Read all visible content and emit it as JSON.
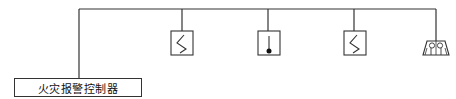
{
  "diagram": {
    "type": "fire-alarm-system-wiring",
    "controller": {
      "label": "火灾报警控制器"
    },
    "devices": [
      {
        "id": "device-1",
        "kind": "smoke-detector",
        "icon": "smoke-detector-icon"
      },
      {
        "id": "device-2",
        "kind": "heat-detector",
        "icon": "heat-detector-icon"
      },
      {
        "id": "device-3",
        "kind": "smoke-detector",
        "icon": "smoke-detector-icon"
      },
      {
        "id": "device-4",
        "kind": "alarm-sounder",
        "icon": "alarm-sounder-icon"
      }
    ],
    "colors": {
      "line": "#333333",
      "background": "#ffffff"
    }
  }
}
